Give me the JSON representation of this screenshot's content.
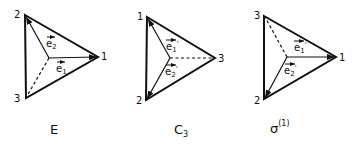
{
  "diagrams": [
    {
      "id": "E",
      "caption": "E",
      "caption_sub": "",
      "caption_sup": "",
      "vertices": [
        {
          "label": "2",
          "x": 25,
          "y": 15
        },
        {
          "label": "1",
          "x": 98,
          "y": 57
        },
        {
          "label": "3",
          "x": 26,
          "y": 98
        }
      ],
      "center": {
        "x": 49,
        "y": 58
      },
      "vectors": [
        {
          "label": "e",
          "sub": "2",
          "prime": "",
          "to_vertex": "2"
        },
        {
          "label": "e",
          "sub": "1",
          "prime": "",
          "to_vertex": "1"
        }
      ],
      "dashed_to_vertex": "3"
    },
    {
      "id": "C3",
      "caption": "C",
      "caption_sub": "3",
      "caption_sup": "",
      "vertices": [
        {
          "label": "1",
          "x": 147,
          "y": 17
        },
        {
          "label": "3",
          "x": 215,
          "y": 58
        },
        {
          "label": "2",
          "x": 146,
          "y": 100
        }
      ],
      "center": {
        "x": 170,
        "y": 58
      },
      "vectors": [
        {
          "label": "e",
          "sub": "1",
          "prime": "'",
          "to_vertex": "1"
        },
        {
          "label": "e",
          "sub": "2",
          "prime": "'",
          "to_vertex": "2"
        }
      ],
      "dashed_to_vertex": "3"
    },
    {
      "id": "sigma1",
      "caption": "σ",
      "caption_sub": "",
      "caption_sup": "(1)",
      "vertices": [
        {
          "label": "3",
          "x": 264,
          "y": 16
        },
        {
          "label": "1",
          "x": 336,
          "y": 57
        },
        {
          "label": "2",
          "x": 264,
          "y": 99
        }
      ],
      "center": {
        "x": 287,
        "y": 57
      },
      "vectors": [
        {
          "label": "e",
          "sub": "1",
          "prime": "'",
          "to_vertex": "1"
        },
        {
          "label": "e",
          "sub": "2",
          "prime": "'",
          "to_vertex": "2"
        }
      ],
      "dashed_to_vertex": "3"
    }
  ],
  "labels": {
    "d1": {
      "v_top": "2",
      "v_right": "1",
      "v_bottom": "3",
      "e_upper": "e",
      "e_upper_sub": "2",
      "e_lower": "e",
      "e_lower_sub": "1",
      "caption": "E"
    },
    "d2": {
      "v_top": "1",
      "v_right": "3",
      "v_bottom": "2",
      "e_upper": "e",
      "e_upper_sub": "1",
      "e_upper_prime": "'",
      "e_lower": "e",
      "e_lower_sub": "2",
      "e_lower_prime": "'",
      "caption": "C",
      "caption_sub": "3"
    },
    "d3": {
      "v_top": "3",
      "v_right": "1",
      "v_bottom": "2",
      "e_upper": "e",
      "e_upper_sub": "1",
      "e_upper_prime": "'",
      "e_lower": "e",
      "e_lower_sub": "2",
      "e_lower_prime": "'",
      "caption": "σ",
      "caption_sup": "(1)"
    }
  },
  "colors": {
    "stroke": "#111111",
    "background": "#ffffff"
  }
}
